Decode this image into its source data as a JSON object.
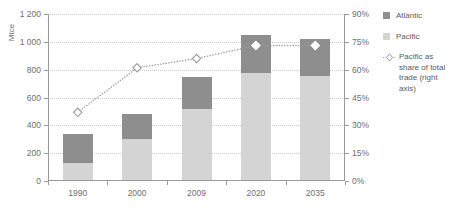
{
  "chart_data": {
    "type": "bar",
    "title": "",
    "subtitle": "",
    "xlabel": "",
    "ylabel": "Mtce",
    "y2label": "",
    "categories": [
      "1990",
      "2000",
      "2009",
      "2020",
      "2035"
    ],
    "ylim": [
      0,
      1200
    ],
    "y2lim": [
      0,
      90
    ],
    "yticks": [
      "0",
      "200",
      "400",
      "600",
      "800",
      "1 000",
      "1 200"
    ],
    "ytick_values": [
      0,
      200,
      400,
      600,
      800,
      1000,
      1200
    ],
    "y2ticks": [
      "0%",
      "15%",
      "30%",
      "45%",
      "60%",
      "75%",
      "90%"
    ],
    "y2tick_values": [
      0,
      15,
      30,
      45,
      60,
      75,
      90
    ],
    "grid": true,
    "stacked": true,
    "legend_position": "right",
    "series": [
      {
        "name": "Pacific",
        "type": "bar",
        "axis": "left",
        "color": "#d4d4d4",
        "values": [
          130,
          305,
          520,
          775,
          755
        ]
      },
      {
        "name": "Atlantic",
        "type": "bar",
        "axis": "left",
        "color": "#8e8e8e",
        "values": [
          210,
          175,
          230,
          275,
          265
        ]
      },
      {
        "name": "Pacific as share of total trade (right axis)",
        "type": "line",
        "axis": "right",
        "color": "#9a9a9a",
        "marker": "diamond",
        "linestyle": "dotted",
        "values": [
          37,
          61,
          66,
          73,
          73
        ]
      }
    ],
    "bar_totals": [
      340,
      480,
      750,
      1050,
      1020
    ]
  },
  "axes": {
    "unit_label": "Mtce"
  },
  "legend": {
    "items": [
      {
        "label": "Atlantic",
        "marker": "square-swatch",
        "color": "#8e8e8e"
      },
      {
        "label": "Pacific",
        "marker": "square-swatch",
        "color": "#d4d4d4"
      },
      {
        "label": "Pacific as share of total trade (right axis)",
        "marker": "dotted-diamond",
        "color": "#9a9a9a"
      }
    ]
  }
}
